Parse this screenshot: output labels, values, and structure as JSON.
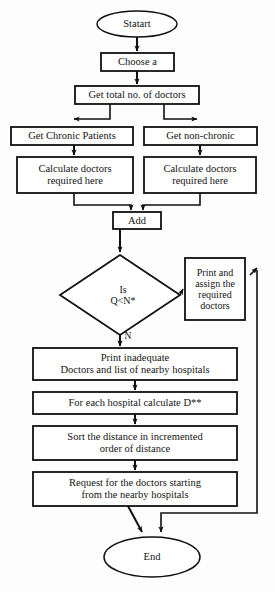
{
  "diagram": {
    "type": "flowchart",
    "colors": {
      "stroke": "#111111",
      "fill": "#ffffff",
      "background": "#fdfdfd",
      "text": "#141414"
    },
    "nodes": [
      {
        "id": "start",
        "shape": "ellipse",
        "label": "Statart"
      },
      {
        "id": "choose",
        "shape": "rectangle",
        "label": "Choose a"
      },
      {
        "id": "get-total",
        "shape": "rectangle",
        "label": "Get total no. of doctors"
      },
      {
        "id": "chronic",
        "shape": "rectangle",
        "label": "Get Chronic Patients"
      },
      {
        "id": "non-chronic",
        "shape": "rectangle",
        "label": "Get non-chronic"
      },
      {
        "id": "calc-left",
        "shape": "rectangle",
        "line1": "Calculate doctors",
        "line2": "required here"
      },
      {
        "id": "calc-right",
        "shape": "rectangle",
        "line1": "Calculate doctors",
        "line2": "required here"
      },
      {
        "id": "add",
        "shape": "rectangle",
        "label": "Add"
      },
      {
        "id": "decision",
        "shape": "diamond",
        "line1": "Is",
        "line2": "Q<N*"
      },
      {
        "id": "print-assign",
        "shape": "rectangle",
        "line1": "Print and",
        "line2": "assign the",
        "line3": "required",
        "line4": "doctors"
      },
      {
        "id": "print-inadequate",
        "shape": "rectangle",
        "line1": "Print inadequate",
        "line2": "Doctors and list of nearby hospitals"
      },
      {
        "id": "calc-d",
        "shape": "rectangle",
        "label": "For each hospital calculate D**"
      },
      {
        "id": "sort",
        "shape": "rectangle",
        "line1": "Sort the distance in incremented",
        "line2": "order of distance"
      },
      {
        "id": "request",
        "shape": "rectangle",
        "line1": "Request for the doctors starting",
        "line2": "from the nearby hospitals"
      },
      {
        "id": "end",
        "shape": "ellipse",
        "label": "End"
      }
    ],
    "edge_labels": [
      {
        "id": "no-branch",
        "label": "N"
      }
    ]
  }
}
